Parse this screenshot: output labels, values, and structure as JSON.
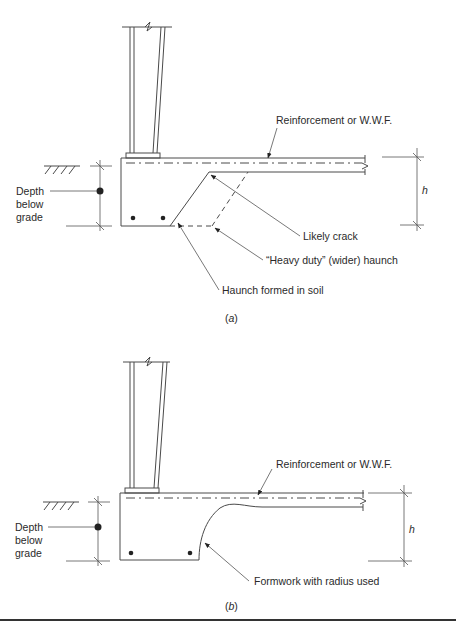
{
  "figure_a": {
    "caption_open": "(",
    "caption_letter": "a",
    "caption_close": ")",
    "labels": {
      "reinforcement": "Reinforcement or W.W.F.",
      "depth_line1": "Depth",
      "depth_line2": "below",
      "depth_line3": "grade",
      "h": "h",
      "likely_crack": "Likely crack",
      "heavy_duty_haunch": "“Heavy duty” (wider) haunch",
      "haunch_formed": "Haunch formed in soil"
    }
  },
  "figure_b": {
    "caption_open": "(",
    "caption_letter": "b",
    "caption_close": ")",
    "labels": {
      "reinforcement": "Reinforcement or W.W.F.",
      "depth_line1": "Depth",
      "depth_line2": "below",
      "depth_line3": "grade",
      "h": "h",
      "formwork_radius": "Formwork with radius used"
    }
  },
  "colors": {
    "line": "#4a4a4a",
    "text": "#2a2a2a",
    "background": "#ffffff",
    "bottom_rule": "#333333"
  }
}
